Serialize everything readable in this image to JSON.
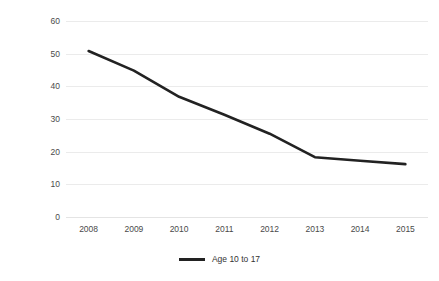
{
  "chart_data": {
    "type": "line",
    "title": "",
    "xlabel": "",
    "ylabel": "Rate per 1000 population",
    "x": [
      "2008",
      "2009",
      "2010",
      "2011",
      "2012",
      "2013",
      "2014",
      "2015"
    ],
    "categories": [
      "2008",
      "2009",
      "2010",
      "2011",
      "2012",
      "2013",
      "2014",
      "2015"
    ],
    "xtick_labels": [
      "2008",
      "2009",
      "2010",
      "2011",
      "2012",
      "2013",
      "2014",
      "2015"
    ],
    "ytick_labels": [
      "0",
      "10",
      "20",
      "30",
      "40",
      "50",
      "60"
    ],
    "ytick_values": [
      0,
      10,
      20,
      30,
      40,
      50,
      60
    ],
    "ylim": [
      0,
      60
    ],
    "grid": "horizontal",
    "legend_position": "bottom-center",
    "series": [
      {
        "name": "Age 10 to 17",
        "color": "#222222",
        "values": [
          50.8,
          44.8,
          36.8,
          31.3,
          25.5,
          18.3,
          17.2,
          16.2
        ]
      }
    ],
    "legend": [
      "Age 10 to 17"
    ],
    "annotations": []
  },
  "axes": {
    "y_title": "Rate per 1000 population",
    "y_ticks": [
      "60",
      "50",
      "40",
      "30",
      "20",
      "10",
      "0"
    ],
    "x_ticks": [
      "2008",
      "2009",
      "2010",
      "2011",
      "2012",
      "2013",
      "2014",
      "2015"
    ]
  },
  "legend": {
    "entries": [
      {
        "label": "Age 10 to 17",
        "swatch_name": "legend-line-swatch"
      }
    ]
  },
  "colors": {
    "series_line": "#222222",
    "gridline": "#ebebeb",
    "tick_text": "#4a4a4a",
    "axis_title_text": "#2e2e2e",
    "background": "#ffffff"
  }
}
